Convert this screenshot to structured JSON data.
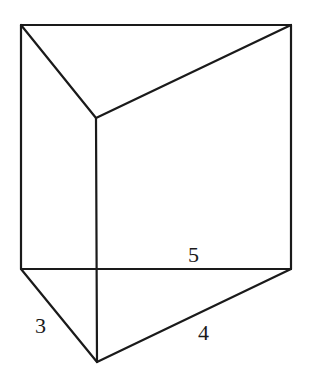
{
  "figure": {
    "type": "triangular-prism",
    "stroke_color": "#1a1a1a",
    "background": "#ffffff",
    "vertices": {
      "top_back_left": [
        21,
        25
      ],
      "top_back_right": [
        291,
        25
      ],
      "top_front": [
        96,
        118
      ],
      "bottom_back_left": [
        21,
        269
      ],
      "bottom_back_right": [
        291,
        269
      ],
      "bottom_front": [
        97,
        362
      ]
    },
    "labels": {
      "hypotenuse": "5",
      "left_leg": "3",
      "right_leg": "4"
    }
  }
}
